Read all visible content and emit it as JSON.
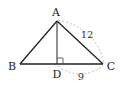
{
  "diagram": {
    "type": "triangle",
    "points": {
      "A": {
        "label": "A",
        "x": 57,
        "y": 21
      },
      "B": {
        "label": "B",
        "x": 20,
        "y": 64
      },
      "C": {
        "label": "C",
        "x": 103,
        "y": 64
      },
      "D": {
        "label": "D",
        "x": 57,
        "y": 64
      }
    },
    "segments": [
      "AB",
      "AC",
      "BC",
      "AD"
    ],
    "right_angle_at": "D",
    "measurements": {
      "AC": {
        "label": "12"
      },
      "DC": {
        "label": "9"
      }
    },
    "colors": {
      "line": "#222222",
      "dashed_arc": "#aaaaaa"
    }
  }
}
